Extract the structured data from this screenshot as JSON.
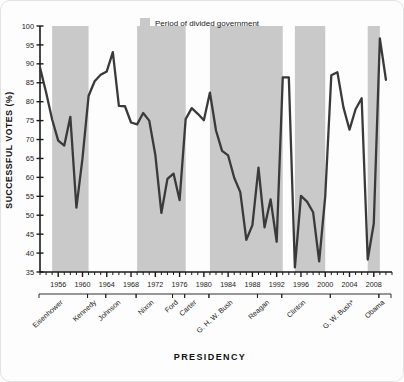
{
  "chart_data": {
    "type": "line",
    "title": "",
    "xlabel": "PRESIDENCY",
    "ylabel": "SUCCESSFUL VOTES (%)",
    "ylim": [
      35,
      100
    ],
    "ytick_step": 5,
    "yticks": [
      35,
      40,
      45,
      50,
      55,
      60,
      65,
      70,
      75,
      80,
      85,
      90,
      95,
      100
    ],
    "xlim": [
      1953,
      2011
    ],
    "xticks_labeled": [
      1956,
      1960,
      1964,
      1968,
      1972,
      1976,
      1980,
      1984,
      1988,
      1992,
      1996,
      2000,
      2004,
      2008
    ],
    "xtick_step": 1,
    "grid": false,
    "legend_position": "top-center",
    "legend": [
      {
        "label": "Period of divided government",
        "color": "#c9c9c9",
        "kind": "shaded-band"
      }
    ],
    "series": [
      {
        "name": "Successful votes",
        "color": "#3a3a3a",
        "x": [
          1953,
          1954,
          1955,
          1956,
          1957,
          1958,
          1959,
          1960,
          1961,
          1962,
          1963,
          1964,
          1965,
          1966,
          1967,
          1968,
          1969,
          1970,
          1971,
          1972,
          1973,
          1974,
          1975,
          1976,
          1977,
          1978,
          1979,
          1980,
          1981,
          1982,
          1983,
          1984,
          1985,
          1986,
          1987,
          1988,
          1989,
          1990,
          1991,
          1992,
          1993,
          1994,
          1995,
          1996,
          1997,
          1998,
          1999,
          2000,
          2001,
          2002,
          2003,
          2004,
          2005,
          2006,
          2007,
          2008,
          2009,
          2010
        ],
        "y": [
          89.0,
          82.5,
          75.3,
          69.7,
          68.4,
          76.0,
          52.0,
          65.0,
          81.5,
          85.4,
          87.1,
          88.0,
          93.1,
          78.9,
          78.8,
          74.5,
          74.0,
          77.0,
          75.0,
          66.0,
          50.6,
          59.6,
          61.0,
          54.0,
          75.4,
          78.3,
          76.8,
          75.1,
          82.4,
          72.4,
          67.0,
          65.8,
          59.9,
          56.1,
          43.5,
          47.4,
          62.6,
          46.8,
          54.2,
          43.0,
          86.4,
          86.4,
          36.2,
          55.1,
          53.6,
          50.8,
          37.8,
          55.0,
          87.0,
          87.8,
          78.5,
          72.6,
          78.0,
          80.9,
          38.3,
          47.8,
          96.7,
          85.8
        ]
      }
    ],
    "shaded_bands": [
      {
        "from": 1955,
        "to": 1960,
        "label": "divided government"
      },
      {
        "from": 1969,
        "to": 1976,
        "label": "divided government"
      },
      {
        "from": 1981,
        "to": 1992,
        "label": "divided government"
      },
      {
        "from": 1995,
        "to": 1999,
        "label": "divided government"
      },
      {
        "from": 2007,
        "to": 2008,
        "label": "divided government"
      }
    ],
    "presidency_brackets": [
      {
        "label": "Eisenhower",
        "from": 1953,
        "to": 1960
      },
      {
        "label": "Kennedy",
        "from": 1961,
        "to": 1963
      },
      {
        "label": "Johnson",
        "from": 1964,
        "to": 1968
      },
      {
        "label": "Nixon",
        "from": 1969,
        "to": 1974
      },
      {
        "label": "Ford",
        "from": 1975,
        "to": 1976
      },
      {
        "label": "Carter",
        "from": 1977,
        "to": 1980
      },
      {
        "label": "G. H. W. Bush",
        "from": 1981,
        "to": 1988
      },
      {
        "label": "Reagan",
        "from": 1989,
        "to": 1992
      },
      {
        "label": "Clinton",
        "from": 1993,
        "to": 2000
      },
      {
        "label": "G. W. Bush*",
        "from": 2001,
        "to": 2008
      },
      {
        "label": "Obama",
        "from": 2009,
        "to": 2010
      }
    ]
  },
  "axes": {
    "y_title": "SUCCESSFUL VOTES (%)",
    "x_title": "PRESIDENCY"
  },
  "legend": {
    "divided_government_label": "Period of divided government",
    "band_color": "#c9c9c9",
    "line_color": "#3a3a3a"
  }
}
